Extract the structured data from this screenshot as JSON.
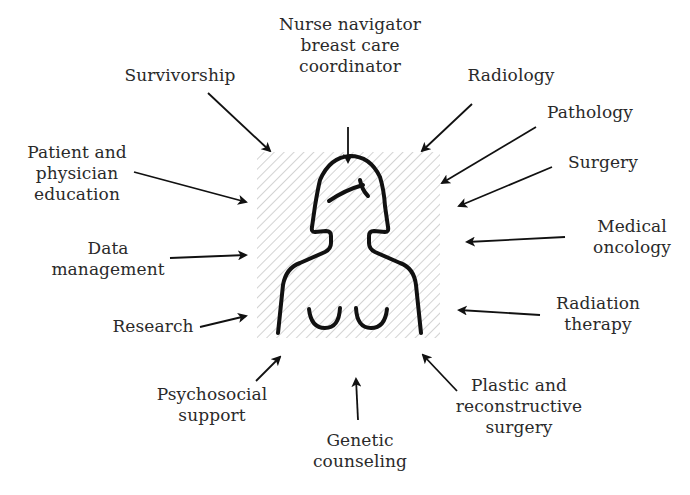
{
  "diagram": {
    "center": {
      "description": "Female torso outline figure on hatched square background",
      "hatch_color": "#c8c8c8",
      "stroke_color": "#111111"
    },
    "labels": [
      {
        "id": "nurse-navigator",
        "text": "Nurse navigator\nbreast care\ncoordinator",
        "position": "top"
      },
      {
        "id": "survivorship",
        "text": "Survivorship",
        "position": "top-left"
      },
      {
        "id": "radiology",
        "text": "Radiology",
        "position": "top-right"
      },
      {
        "id": "pathology",
        "text": "Pathology",
        "position": "right"
      },
      {
        "id": "surgery",
        "text": "Surgery",
        "position": "right"
      },
      {
        "id": "patient-physician-education",
        "text": "Patient and\nphysician\neducation",
        "position": "left"
      },
      {
        "id": "medical-oncology",
        "text": "Medical\noncology",
        "position": "right"
      },
      {
        "id": "data-management",
        "text": "Data\nmanagement",
        "position": "left"
      },
      {
        "id": "radiation-therapy",
        "text": "Radiation\ntherapy",
        "position": "right"
      },
      {
        "id": "research",
        "text": "Research",
        "position": "left"
      },
      {
        "id": "psychosocial-support",
        "text": "Psychosocial\nsupport",
        "position": "bottom-left"
      },
      {
        "id": "genetic-counseling",
        "text": "Genetic\ncounseling",
        "position": "bottom"
      },
      {
        "id": "plastic-reconstructive-surgery",
        "text": "Plastic and\nreconstructive\nsurgery",
        "position": "bottom-right"
      }
    ]
  }
}
